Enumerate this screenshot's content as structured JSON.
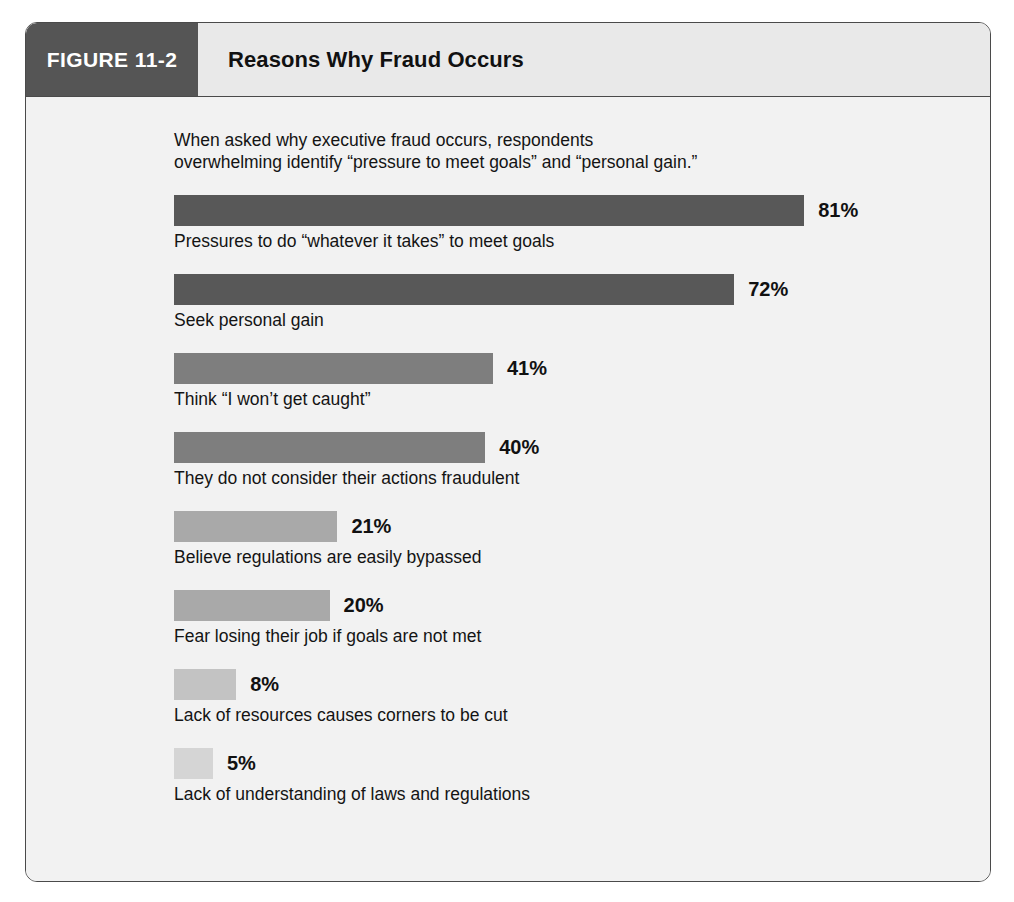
{
  "figure": {
    "badge_label": "FIGURE 11-2",
    "title": "Reasons Why Fraud Occurs",
    "intro": "When asked why executive fraud occurs, respondents\noverwhelming identify “pressure to meet goals” and “personal gain.”"
  },
  "colors": {
    "badge_background": "#555555",
    "header_background": "#e9e9e9",
    "body_background": "#f2f2f2",
    "frame_border": "#4a4a4a",
    "bar_dark": "#585858",
    "bar_medium": "#7e7e7e",
    "bar_light": "#a9a9a9",
    "bar_lighter": "#c3c3c3",
    "bar_lightest": "#d5d5d5",
    "text": "#141414"
  },
  "chart_data": {
    "type": "bar",
    "orientation": "horizontal",
    "title": "Reasons Why Fraud Occurs",
    "subtitle": "When asked why executive fraud occurs, respondents overwhelming identify “pressure to meet goals” and “personal gain.”",
    "xlabel": "",
    "ylabel": "",
    "xlim": [
      0,
      100
    ],
    "grid": false,
    "legend": false,
    "value_suffix": "%",
    "categories": [
      "Pressures to do “whatever it takes” to meet goals",
      "Seek personal gain",
      "Think “I won’t get caught”",
      "They do not consider their actions fraudulent",
      "Believe regulations are easily bypassed",
      "Fear losing their job if goals are not met",
      "Lack of resources causes corners to be cut",
      "Lack of understanding of laws and regulations"
    ],
    "values": [
      81,
      72,
      41,
      40,
      21,
      20,
      8,
      5
    ],
    "bars": [
      {
        "label": "Pressures to do “whatever it takes” to meet goals",
        "value": 81,
        "value_text": "81%",
        "color": "#585858"
      },
      {
        "label": "Seek personal gain",
        "value": 72,
        "value_text": "72%",
        "color": "#585858"
      },
      {
        "label": "Think “I won’t get caught”",
        "value": 41,
        "value_text": "41%",
        "color": "#7e7e7e"
      },
      {
        "label": "They do not consider their actions fraudulent",
        "value": 40,
        "value_text": "40%",
        "color": "#7e7e7e"
      },
      {
        "label": "Believe regulations are easily bypassed",
        "value": 21,
        "value_text": "21%",
        "color": "#a9a9a9"
      },
      {
        "label": "Fear losing their job if goals are not met",
        "value": 20,
        "value_text": "20%",
        "color": "#a9a9a9"
      },
      {
        "label": "Lack of resources causes corners to be cut",
        "value": 8,
        "value_text": "8%",
        "color": "#c3c3c3"
      },
      {
        "label": "Lack of understanding of laws and regulations",
        "value": 5,
        "value_text": "5%",
        "color": "#d5d5d5"
      }
    ]
  }
}
